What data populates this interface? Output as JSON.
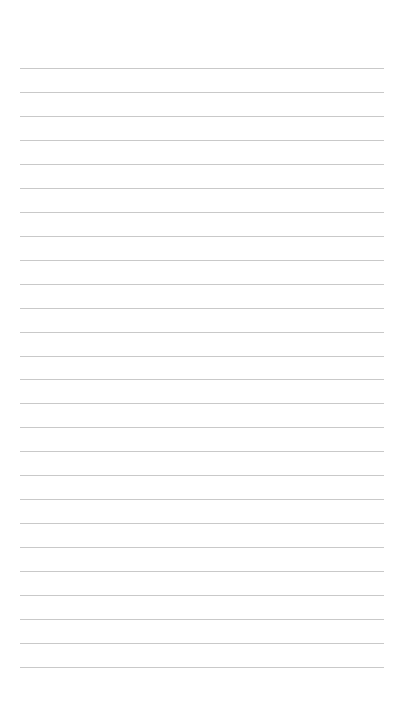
{
  "page": {
    "type": "blank-lined-paper",
    "line_count": 26,
    "first_line_y": 68,
    "line_spacing": 23.96,
    "line_left": 20,
    "line_width": 364,
    "line_color": "#c9c9c9",
    "background_color": "#ffffff"
  }
}
